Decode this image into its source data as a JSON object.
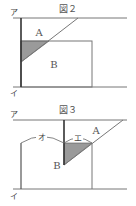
{
  "figure2": {
    "title": "図２",
    "label_top": "ア",
    "label_bottom": "イ",
    "region_a": "A",
    "region_b": "B"
  },
  "figure3": {
    "title": "図３",
    "label_top": "ア",
    "label_bottom": "イ",
    "region_a": "A",
    "region_b": "B",
    "arc_left": "オ",
    "arc_right": "エ"
  },
  "colors": {
    "line": "#777777",
    "bold_line": "#333333",
    "shade": "#9a9a9a"
  }
}
